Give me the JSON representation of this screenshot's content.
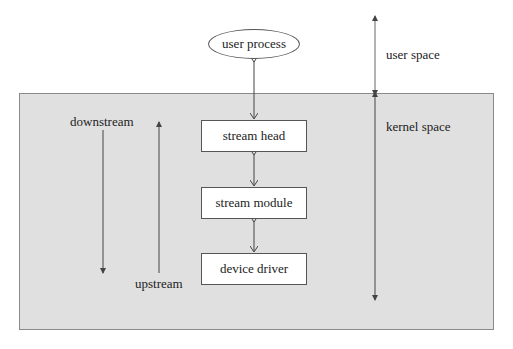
{
  "diagram": {
    "title": "",
    "regions": {
      "user_space": "user space",
      "kernel_space": "kernel space"
    },
    "nodes": {
      "user_process": "user process",
      "stream_head": "stream head",
      "stream_module": "stream module",
      "device_driver": "device driver"
    },
    "direction_labels": {
      "downstream": "downstream",
      "upstream": "upstream"
    },
    "edges": [
      {
        "from": "user process",
        "to": "stream head",
        "type": "bidirectional"
      },
      {
        "from": "stream head",
        "to": "stream module",
        "type": "bidirectional"
      },
      {
        "from": "stream module",
        "to": "device driver",
        "type": "bidirectional"
      }
    ],
    "colors": {
      "kernel_fill": "#e0e0e0",
      "line": "#555555",
      "box_fill": "#ffffff"
    }
  }
}
